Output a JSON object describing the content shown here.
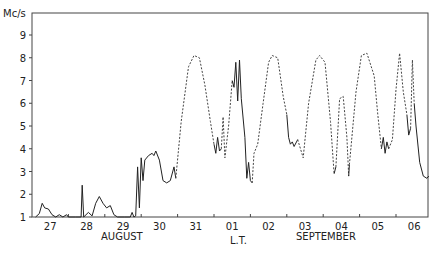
{
  "chart_data": {
    "type": "line",
    "title": "",
    "ylabel": "Mc/s",
    "xlabel": "L.T.",
    "ylim": [
      1,
      10
    ],
    "yticks": [
      1,
      2,
      3,
      4,
      5,
      6,
      7,
      8,
      9
    ],
    "x_unit": "days from 27 Aug 00h L.T.",
    "xlim": [
      0,
      10.9
    ],
    "x_tick_labels": [
      "27",
      "28",
      "29",
      "30",
      "31",
      "01",
      "02",
      "03",
      "04",
      "05",
      "06"
    ],
    "month_labels": [
      {
        "text": "AUGUST",
        "under": "29"
      },
      {
        "text": "SEPTEMBER",
        "under": "03-04"
      }
    ],
    "grid": false,
    "legend": null,
    "series": [
      {
        "name": "observed-1",
        "style": "solid",
        "points": [
          [
            0.1,
            1.0
          ],
          [
            0.2,
            1.15
          ],
          [
            0.28,
            1.6
          ],
          [
            0.35,
            1.4
          ],
          [
            0.45,
            1.35
          ],
          [
            0.55,
            1.1
          ],
          [
            0.65,
            1.0
          ],
          [
            0.75,
            1.1
          ],
          [
            0.85,
            1.0
          ],
          [
            0.95,
            1.1
          ],
          [
            1.0,
            1.0
          ],
          [
            1.2,
            1.0
          ],
          [
            1.35,
            1.0
          ],
          [
            1.38,
            2.4
          ],
          [
            1.42,
            1.0
          ],
          [
            1.55,
            1.2
          ],
          [
            1.65,
            1.05
          ],
          [
            1.75,
            1.6
          ],
          [
            1.85,
            1.9
          ],
          [
            1.95,
            1.6
          ],
          [
            2.05,
            1.4
          ],
          [
            2.15,
            1.5
          ],
          [
            2.25,
            1.1
          ],
          [
            2.35,
            1.0
          ],
          [
            2.55,
            1.0
          ],
          [
            2.7,
            1.0
          ],
          [
            2.75,
            1.2
          ],
          [
            2.8,
            1.0
          ],
          [
            2.85,
            1.05
          ],
          [
            2.9,
            3.2
          ],
          [
            2.95,
            1.4
          ],
          [
            3.0,
            3.6
          ],
          [
            3.05,
            2.6
          ],
          [
            3.1,
            3.5
          ],
          [
            3.2,
            3.7
          ],
          [
            3.3,
            3.8
          ],
          [
            3.35,
            3.7
          ],
          [
            3.4,
            3.9
          ],
          [
            3.5,
            3.5
          ],
          [
            3.6,
            2.6
          ],
          [
            3.7,
            2.5
          ],
          [
            3.8,
            2.6
          ],
          [
            3.9,
            3.2
          ],
          [
            3.95,
            2.7
          ]
        ]
      },
      {
        "name": "interpolated-1",
        "style": "dashed",
        "points": [
          [
            3.95,
            2.7
          ],
          [
            4.1,
            5.2
          ],
          [
            4.3,
            7.6
          ],
          [
            4.45,
            8.1
          ],
          [
            4.6,
            8.0
          ],
          [
            4.75,
            6.8
          ],
          [
            4.9,
            5.2
          ],
          [
            5.0,
            4.2
          ]
        ]
      },
      {
        "name": "observed-2",
        "style": "solid",
        "points": [
          [
            5.0,
            4.2
          ],
          [
            5.05,
            3.8
          ],
          [
            5.1,
            4.5
          ],
          [
            5.15,
            3.9
          ],
          [
            5.2,
            4.0
          ]
        ]
      },
      {
        "name": "interpolated-2",
        "style": "dashed",
        "points": [
          [
            5.2,
            4.0
          ],
          [
            5.25,
            5.4
          ],
          [
            5.3,
            3.6
          ],
          [
            5.4,
            5.0
          ],
          [
            5.5,
            7.0
          ]
        ]
      },
      {
        "name": "observed-3",
        "style": "solid",
        "points": [
          [
            5.5,
            7.0
          ],
          [
            5.55,
            6.7
          ],
          [
            5.6,
            7.8
          ],
          [
            5.65,
            6.1
          ],
          [
            5.7,
            7.9
          ],
          [
            5.75,
            6.2
          ],
          [
            5.85,
            4.5
          ],
          [
            5.9,
            2.7
          ],
          [
            5.95,
            3.4
          ],
          [
            6.0,
            2.6
          ],
          [
            6.05,
            2.5
          ]
        ]
      },
      {
        "name": "interpolated-3",
        "style": "dashed",
        "points": [
          [
            6.05,
            2.5
          ],
          [
            6.1,
            3.8
          ],
          [
            6.2,
            4.2
          ],
          [
            6.35,
            6.0
          ],
          [
            6.5,
            7.8
          ],
          [
            6.6,
            8.1
          ],
          [
            6.75,
            8.0
          ],
          [
            6.9,
            6.3
          ],
          [
            7.0,
            5.5
          ]
        ]
      },
      {
        "name": "observed-4",
        "style": "solid",
        "points": [
          [
            7.0,
            5.5
          ],
          [
            7.05,
            4.5
          ],
          [
            7.1,
            4.2
          ],
          [
            7.15,
            4.3
          ],
          [
            7.2,
            4.1
          ],
          [
            7.3,
            4.4
          ]
        ]
      },
      {
        "name": "interpolated-4",
        "style": "dashed",
        "points": [
          [
            7.3,
            4.4
          ],
          [
            7.45,
            3.6
          ],
          [
            7.6,
            6.0
          ],
          [
            7.8,
            7.9
          ],
          [
            7.9,
            8.1
          ],
          [
            8.05,
            7.8
          ],
          [
            8.2,
            5.2
          ],
          [
            8.3,
            2.9
          ]
        ]
      },
      {
        "name": "observed-5",
        "style": "solid",
        "points": [
          [
            8.3,
            2.9
          ],
          [
            8.35,
            3.2
          ]
        ]
      },
      {
        "name": "interpolated-5",
        "style": "dashed",
        "points": [
          [
            8.35,
            3.2
          ],
          [
            8.45,
            6.2
          ],
          [
            8.55,
            6.3
          ],
          [
            8.65,
            4.5
          ],
          [
            8.7,
            2.8
          ]
        ]
      },
      {
        "name": "observed-6",
        "style": "solid",
        "points": [
          [
            8.7,
            2.8
          ],
          [
            8.72,
            3.3
          ]
        ]
      },
      {
        "name": "interpolated-6",
        "style": "dashed",
        "points": [
          [
            8.72,
            3.3
          ],
          [
            8.9,
            6.5
          ],
          [
            9.05,
            8.1
          ],
          [
            9.2,
            8.2
          ],
          [
            9.4,
            7.2
          ],
          [
            9.5,
            5.5
          ],
          [
            9.6,
            4.0
          ]
        ]
      },
      {
        "name": "observed-7",
        "style": "solid",
        "points": [
          [
            9.6,
            4.0
          ],
          [
            9.65,
            4.5
          ],
          [
            9.7,
            3.8
          ],
          [
            9.75,
            4.3
          ],
          [
            9.8,
            4.0
          ]
        ]
      },
      {
        "name": "interpolated-7",
        "style": "dashed",
        "points": [
          [
            9.8,
            4.0
          ],
          [
            9.9,
            4.4
          ],
          [
            10.0,
            6.6
          ],
          [
            10.1,
            8.2
          ],
          [
            10.2,
            6.5
          ],
          [
            10.3,
            5.5
          ]
        ]
      },
      {
        "name": "observed-8",
        "style": "solid",
        "points": [
          [
            10.3,
            5.5
          ],
          [
            10.35,
            4.6
          ],
          [
            10.4,
            4.9
          ]
        ]
      },
      {
        "name": "interpolated-8",
        "style": "dashed",
        "points": [
          [
            10.4,
            4.9
          ],
          [
            10.45,
            7.9
          ],
          [
            10.5,
            6.0
          ]
        ]
      },
      {
        "name": "observed-9",
        "style": "solid",
        "points": [
          [
            10.5,
            6.0
          ],
          [
            10.55,
            5.0
          ],
          [
            10.65,
            3.4
          ],
          [
            10.75,
            2.8
          ],
          [
            10.85,
            2.7
          ],
          [
            10.9,
            2.8
          ]
        ]
      }
    ]
  },
  "axes": {
    "y_unit_label": "Mc/s",
    "x_unit_label": "L.T.",
    "y_tick_labels": [
      "1",
      "2",
      "3",
      "4",
      "5",
      "6",
      "7",
      "8",
      "9"
    ],
    "x_tick_labels": [
      "27",
      "28",
      "29",
      "30",
      "31",
      "01",
      "02",
      "03",
      "04",
      "05",
      "06"
    ],
    "month_august": "AUGUST",
    "month_september": "SEPTEMBER"
  }
}
